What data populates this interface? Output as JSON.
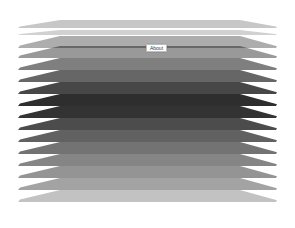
{
  "canvas": {
    "width": 295,
    "height": 228,
    "background": "#ffffff"
  },
  "layers": [
    {
      "y": 20,
      "h": 8,
      "color": "#000000",
      "opacity": 0.22
    },
    {
      "y": 30,
      "h": 5,
      "color": "#000000",
      "opacity": 0.18
    },
    {
      "y": 36,
      "h": 12,
      "color": "#000000",
      "opacity": 0.32
    },
    {
      "y": 46,
      "h": 12,
      "color": "#000000",
      "opacity": 0.4
    },
    {
      "y": 58,
      "h": 12,
      "color": "#000000",
      "opacity": 0.5
    },
    {
      "y": 70,
      "h": 12,
      "color": "#000000",
      "opacity": 0.6
    },
    {
      "y": 82,
      "h": 12,
      "color": "#000000",
      "opacity": 0.72
    },
    {
      "y": 94,
      "h": 12,
      "color": "#000000",
      "opacity": 0.82
    },
    {
      "y": 106,
      "h": 12,
      "color": "#000000",
      "opacity": 0.8
    },
    {
      "y": 118,
      "h": 12,
      "color": "#000000",
      "opacity": 0.7
    },
    {
      "y": 130,
      "h": 12,
      "color": "#000000",
      "opacity": 0.62
    },
    {
      "y": 142,
      "h": 12,
      "color": "#000000",
      "opacity": 0.55
    },
    {
      "y": 154,
      "h": 12,
      "color": "#000000",
      "opacity": 0.48
    },
    {
      "y": 166,
      "h": 12,
      "color": "#000000",
      "opacity": 0.42
    },
    {
      "y": 178,
      "h": 12,
      "color": "#000000",
      "opacity": 0.36
    },
    {
      "y": 190,
      "h": 12,
      "color": "#000000",
      "opacity": 0.24
    }
  ],
  "about_button": {
    "label": "About"
  }
}
